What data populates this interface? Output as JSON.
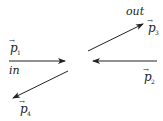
{
  "diagram": {
    "type": "scattering-momenta",
    "colors": {
      "stroke": "#222222",
      "background": "#ffffff"
    },
    "arrows": [
      {
        "id": "p1",
        "symbol": "p",
        "index": "1",
        "direction": "incoming-from-left"
      },
      {
        "id": "p2",
        "symbol": "p",
        "index": "2",
        "direction": "incoming-from-right"
      },
      {
        "id": "p3",
        "symbol": "p",
        "index": "3",
        "direction": "outgoing-up-right"
      },
      {
        "id": "p4",
        "symbol": "p",
        "index": "4",
        "direction": "outgoing-down-left"
      }
    ],
    "labels": {
      "in": "in",
      "out": "out",
      "p1_symbol": "p",
      "p1_index": "1",
      "p2_symbol": "p",
      "p2_index": "2",
      "p3_symbol": "p",
      "p3_index": "3",
      "p4_symbol": "p",
      "p4_index": "4",
      "vec_mark": "→"
    }
  }
}
